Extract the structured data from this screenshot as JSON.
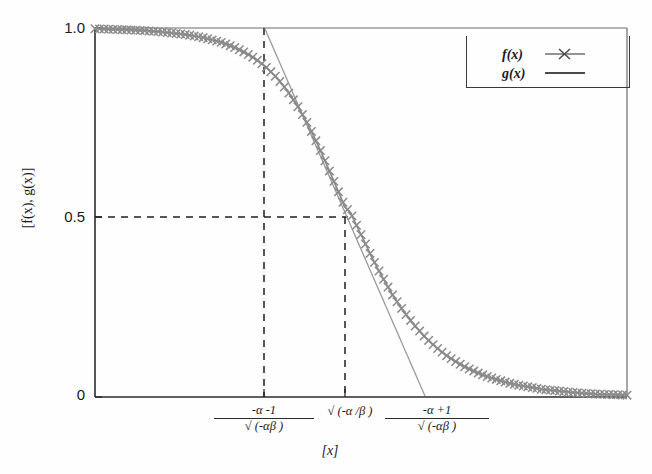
{
  "chart_data": {
    "type": "line",
    "title": "",
    "xlabel": "[x]",
    "ylabel": "[f(x), g(x)]",
    "ylim": [
      0,
      1.0
    ],
    "y_ticks": [
      "1.0",
      "0.5",
      "0"
    ],
    "y_tick_values": [
      1.0,
      0.5,
      0.0
    ],
    "grid": false,
    "legend_position": "top-right",
    "x_tick_labels": [
      {
        "numerator": "-α -1",
        "denominator": "√ (-αβ  )",
        "kind": "fraction"
      },
      {
        "text": "√ (-α /β )",
        "kind": "plain"
      },
      {
        "numerator": "-α +1",
        "denominator": "√ (-αβ  )",
        "kind": "fraction"
      }
    ],
    "series": [
      {
        "name": "f(x)",
        "marker": "x",
        "color": "#8a8a8a",
        "description": "Decreasing sigmoid curve from 1.0 to 0, midpoint 0.5 at sqrt(-alpha/beta)",
        "x": [
          0.0,
          0.02,
          0.04,
          0.06,
          0.08,
          0.1,
          0.12,
          0.14,
          0.16,
          0.18,
          0.2,
          0.22,
          0.24,
          0.26,
          0.28,
          0.3,
          0.32,
          0.34,
          0.36,
          0.38,
          0.4,
          0.42,
          0.44,
          0.46,
          0.47,
          0.48,
          0.49,
          0.5,
          0.51,
          0.52,
          0.53,
          0.54,
          0.56,
          0.58,
          0.6,
          0.62,
          0.64,
          0.66,
          0.68,
          0.7,
          0.72,
          0.74,
          0.76,
          0.78,
          0.8,
          0.82,
          0.84,
          0.86,
          0.88,
          0.9,
          0.92,
          0.94,
          0.96,
          0.98,
          1.0
        ],
        "y": [
          0.998,
          0.997,
          0.996,
          0.995,
          0.994,
          0.992,
          0.99,
          0.987,
          0.984,
          0.98,
          0.975,
          0.968,
          0.96,
          0.949,
          0.935,
          0.918,
          0.896,
          0.868,
          0.833,
          0.79,
          0.74,
          0.68,
          0.615,
          0.548,
          0.515,
          0.5,
          0.47,
          0.44,
          0.41,
          0.38,
          0.352,
          0.325,
          0.275,
          0.232,
          0.195,
          0.163,
          0.136,
          0.113,
          0.094,
          0.078,
          0.065,
          0.054,
          0.045,
          0.037,
          0.031,
          0.026,
          0.021,
          0.018,
          0.015,
          0.012,
          0.01,
          0.008,
          0.007,
          0.006,
          0.005
        ]
      },
      {
        "name": "g(x)",
        "marker": "none",
        "color": "#9a9a9a",
        "description": "Tangent line to f(x) at the inflection point",
        "x": [
          0.32,
          0.62
        ],
        "y": [
          1.0,
          0.0
        ]
      }
    ],
    "annotations": [
      {
        "name": "vline-left",
        "type": "vertical-dashed-line",
        "x": 0.32,
        "y_from": 0.0,
        "y_to": 1.0
      },
      {
        "name": "vline-mid",
        "type": "vertical-dashed-line",
        "x": 0.474,
        "y_from": 0.0,
        "y_to": 0.5
      },
      {
        "name": "hline-half",
        "type": "horizontal-dashed-line",
        "y": 0.5,
        "x_from": 0.0,
        "x_to": 0.474
      }
    ]
  },
  "legend": {
    "entries": [
      {
        "label": "f(x)",
        "key": "line-with-x-marker"
      },
      {
        "label": "g(x)",
        "key": "plain-line"
      }
    ]
  },
  "axes": {
    "y_label": "[f(x), g(x)]",
    "x_label": "[x]",
    "y_tick_top": "1.0",
    "y_tick_mid": "0.5",
    "y_tick_bottom": "0"
  }
}
